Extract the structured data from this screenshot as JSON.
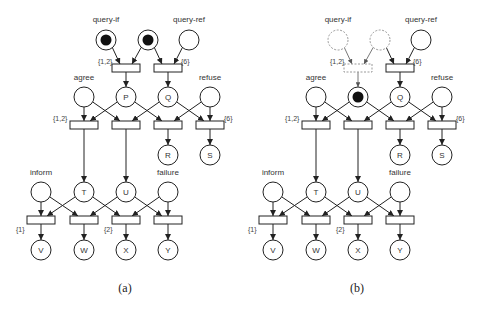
{
  "colors": {
    "stroke": "#222222",
    "dashed": "#999999",
    "token": "#111111",
    "text": "#333333"
  },
  "place_radius": 10,
  "transition": {
    "width": 28,
    "height": 8
  },
  "panels": [
    {
      "id": "a",
      "caption": "(a)",
      "caption_pos": [
        125,
        292
      ],
      "offset_x": 0,
      "places": [
        {
          "id": "qif",
          "x": 106,
          "y": 40,
          "label": "",
          "name": "query-if",
          "name_pos": [
            106,
            22
          ],
          "tokens": 1
        },
        {
          "id": "qmid",
          "x": 148,
          "y": 40,
          "label": "",
          "tokens": 1
        },
        {
          "id": "qref",
          "x": 189,
          "y": 40,
          "label": "",
          "name": "query-ref",
          "name_pos": [
            189,
            22
          ],
          "tokens": 0
        },
        {
          "id": "agree",
          "x": 84,
          "y": 97,
          "label": "",
          "name": "agree",
          "name_pos": [
            84,
            80
          ],
          "tokens": 0
        },
        {
          "id": "P",
          "x": 126,
          "y": 97,
          "label": "P",
          "tokens": 0
        },
        {
          "id": "Q",
          "x": 168,
          "y": 97,
          "label": "Q",
          "tokens": 0
        },
        {
          "id": "refuse",
          "x": 210,
          "y": 97,
          "label": "",
          "name": "refuse",
          "name_pos": [
            210,
            80
          ],
          "tokens": 0
        },
        {
          "id": "R",
          "x": 168,
          "y": 155,
          "label": "R",
          "tokens": 0
        },
        {
          "id": "S",
          "x": 210,
          "y": 155,
          "label": "S",
          "tokens": 0
        },
        {
          "id": "inform",
          "x": 41,
          "y": 192,
          "label": "",
          "name": "inform",
          "name_pos": [
            41,
            175
          ],
          "tokens": 0
        },
        {
          "id": "T",
          "x": 84,
          "y": 192,
          "label": "T",
          "tokens": 0
        },
        {
          "id": "U",
          "x": 126,
          "y": 192,
          "label": "U",
          "tokens": 0
        },
        {
          "id": "failure",
          "x": 168,
          "y": 192,
          "label": "",
          "name": "failure",
          "name_pos": [
            168,
            175
          ],
          "tokens": 0
        },
        {
          "id": "V",
          "x": 41,
          "y": 250,
          "label": "V",
          "tokens": 0
        },
        {
          "id": "W",
          "x": 84,
          "y": 250,
          "label": "W",
          "tokens": 0
        },
        {
          "id": "X",
          "x": 126,
          "y": 250,
          "label": "X",
          "tokens": 0
        },
        {
          "id": "Y",
          "x": 168,
          "y": 250,
          "label": "Y",
          "tokens": 0
        }
      ],
      "transitions": [
        {
          "id": "t1",
          "x": 126,
          "y": 68,
          "weight": "{1,2}",
          "weight_pos": [
            98,
            64
          ]
        },
        {
          "id": "t2",
          "x": 168,
          "y": 68,
          "weight": "{6}",
          "weight_pos": [
            181,
            64
          ]
        },
        {
          "id": "t3",
          "x": 84,
          "y": 125,
          "weight": "{1,2}",
          "weight_pos": [
            53,
            121
          ]
        },
        {
          "id": "t4",
          "x": 126,
          "y": 125
        },
        {
          "id": "t5",
          "x": 168,
          "y": 125
        },
        {
          "id": "t6",
          "x": 210,
          "y": 125,
          "weight": "{6}",
          "weight_pos": [
            224,
            121
          ]
        },
        {
          "id": "t7",
          "x": 41,
          "y": 220,
          "weight": "{1}",
          "weight_pos": [
            16,
            232
          ]
        },
        {
          "id": "t8",
          "x": 84,
          "y": 220
        },
        {
          "id": "t9",
          "x": 126,
          "y": 220,
          "weight": "{2}",
          "weight_pos": [
            104,
            232
          ]
        },
        {
          "id": "t10",
          "x": 168,
          "y": 220
        }
      ],
      "dashed": []
    },
    {
      "id": "b",
      "caption": "(b)",
      "caption_pos": [
        357,
        292
      ],
      "offset_x": 232,
      "places": [
        {
          "id": "qif",
          "x": 106,
          "y": 40,
          "label": "",
          "name": "query-if",
          "name_pos": [
            106,
            22
          ],
          "tokens": 0,
          "dashed": true
        },
        {
          "id": "qmid",
          "x": 148,
          "y": 40,
          "label": "",
          "tokens": 0,
          "dashed": true
        },
        {
          "id": "qref",
          "x": 189,
          "y": 40,
          "label": "",
          "name": "query-ref",
          "name_pos": [
            189,
            22
          ],
          "tokens": 0
        },
        {
          "id": "agree",
          "x": 84,
          "y": 97,
          "label": "",
          "name": "agree",
          "name_pos": [
            84,
            80
          ],
          "tokens": 0
        },
        {
          "id": "P",
          "x": 126,
          "y": 97,
          "label": "",
          "tokens": 1
        },
        {
          "id": "Q",
          "x": 168,
          "y": 97,
          "label": "Q",
          "tokens": 0
        },
        {
          "id": "refuse",
          "x": 210,
          "y": 97,
          "label": "",
          "name": "refuse",
          "name_pos": [
            210,
            80
          ],
          "tokens": 0
        },
        {
          "id": "R",
          "x": 168,
          "y": 155,
          "label": "R",
          "tokens": 0
        },
        {
          "id": "S",
          "x": 210,
          "y": 155,
          "label": "S",
          "tokens": 0
        },
        {
          "id": "inform",
          "x": 41,
          "y": 192,
          "label": "",
          "name": "inform",
          "name_pos": [
            41,
            175
          ],
          "tokens": 0
        },
        {
          "id": "T",
          "x": 84,
          "y": 192,
          "label": "T",
          "tokens": 0
        },
        {
          "id": "U",
          "x": 126,
          "y": 192,
          "label": "U",
          "tokens": 0
        },
        {
          "id": "failure",
          "x": 168,
          "y": 192,
          "label": "",
          "name": "failure",
          "name_pos": [
            168,
            175
          ],
          "tokens": 0
        },
        {
          "id": "V",
          "x": 41,
          "y": 250,
          "label": "V",
          "tokens": 0
        },
        {
          "id": "W",
          "x": 84,
          "y": 250,
          "label": "W",
          "tokens": 0
        },
        {
          "id": "X",
          "x": 126,
          "y": 250,
          "label": "X",
          "tokens": 0
        },
        {
          "id": "Y",
          "x": 168,
          "y": 250,
          "label": "Y",
          "tokens": 0
        }
      ],
      "transitions": [
        {
          "id": "t1",
          "x": 126,
          "y": 68,
          "weight": "{1,2}",
          "weight_pos": [
            98,
            64
          ],
          "dashed": true
        },
        {
          "id": "t2",
          "x": 168,
          "y": 68,
          "weight": "{6}",
          "weight_pos": [
            181,
            64
          ]
        },
        {
          "id": "t3",
          "x": 84,
          "y": 125,
          "weight": "{1,2}",
          "weight_pos": [
            53,
            121
          ]
        },
        {
          "id": "t4",
          "x": 126,
          "y": 125
        },
        {
          "id": "t5",
          "x": 168,
          "y": 125
        },
        {
          "id": "t6",
          "x": 210,
          "y": 125,
          "weight": "{6}",
          "weight_pos": [
            224,
            121
          ]
        },
        {
          "id": "t7",
          "x": 41,
          "y": 220,
          "weight": "{1}",
          "weight_pos": [
            16,
            232
          ]
        },
        {
          "id": "t8",
          "x": 84,
          "y": 220
        },
        {
          "id": "t9",
          "x": 126,
          "y": 220,
          "weight": "{2}",
          "weight_pos": [
            104,
            232
          ]
        },
        {
          "id": "t10",
          "x": 168,
          "y": 220
        }
      ]
    }
  ],
  "arcs": [
    {
      "from": "qif",
      "to": "t1",
      "dashed_in_b": true
    },
    {
      "from": "qmid",
      "to": "t1",
      "dashed_in_b": true
    },
    {
      "from": "qmid",
      "to": "t2"
    },
    {
      "from": "qref",
      "to": "t2"
    },
    {
      "from": "t1",
      "to": "P",
      "dashed_in_b": true
    },
    {
      "from": "t2",
      "to": "Q"
    },
    {
      "from": "agree",
      "to": "t3"
    },
    {
      "from": "agree",
      "to": "t4"
    },
    {
      "from": "P",
      "to": "t3"
    },
    {
      "from": "P",
      "to": "t5"
    },
    {
      "from": "Q",
      "to": "t4"
    },
    {
      "from": "Q",
      "to": "t6"
    },
    {
      "from": "refuse",
      "to": "t5"
    },
    {
      "from": "refuse",
      "to": "t6"
    },
    {
      "from": "t3",
      "to": "T"
    },
    {
      "from": "t4",
      "to": "U"
    },
    {
      "from": "t5",
      "to": "R"
    },
    {
      "from": "t6",
      "to": "S"
    },
    {
      "from": "inform",
      "to": "t7"
    },
    {
      "from": "inform",
      "to": "t8"
    },
    {
      "from": "T",
      "to": "t7"
    },
    {
      "from": "T",
      "to": "t9"
    },
    {
      "from": "U",
      "to": "t8"
    },
    {
      "from": "U",
      "to": "t10"
    },
    {
      "from": "failure",
      "to": "t9"
    },
    {
      "from": "failure",
      "to": "t10"
    },
    {
      "from": "t7",
      "to": "V"
    },
    {
      "from": "t8",
      "to": "W"
    },
    {
      "from": "t9",
      "to": "X"
    },
    {
      "from": "t10",
      "to": "Y"
    }
  ]
}
